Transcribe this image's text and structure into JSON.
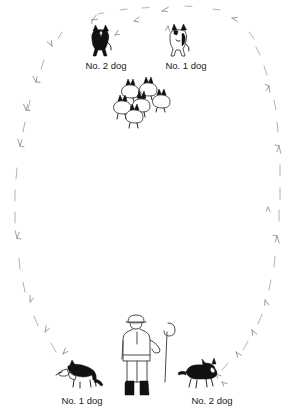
{
  "figure": {
    "background_color": "#ffffff",
    "ink_color": "#111111",
    "boundary_color": "#8a8a8a",
    "width": 293,
    "height": 414
  },
  "labels": {
    "top_left": "No. 2 dog",
    "top_right": "No. 1 dog",
    "bottom_left": "No. 1 dog",
    "bottom_right": "No. 2 dog"
  },
  "actors": {
    "shepherd": {
      "name": "shepherd",
      "holds": "crook",
      "position": "bottom-center"
    },
    "flock": {
      "name": "sheep-flock",
      "count": 6,
      "position": "upper-center"
    },
    "dogs": [
      {
        "id": "top-left-dog",
        "label": "No. 2 dog",
        "fill": "dark",
        "position": "top-left"
      },
      {
        "id": "top-right-dog",
        "label": "No. 1 dog",
        "fill": "light",
        "position": "top-right"
      },
      {
        "id": "bottom-left-dog",
        "label": "No. 1 dog",
        "fill": "dark",
        "position": "bottom-left",
        "facing": "left"
      },
      {
        "id": "bottom-right-dog",
        "label": "No. 2 dog",
        "fill": "dark",
        "position": "bottom-right",
        "facing": "right"
      }
    ]
  },
  "boundary": {
    "name": "field-boundary",
    "style": "dashed-oval-of-grass-tufts",
    "center_x": 146,
    "center_y": 200,
    "radius_x": 137,
    "radius_y": 196
  }
}
